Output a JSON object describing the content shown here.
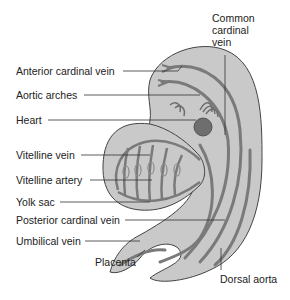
{
  "diagram": {
    "colors": {
      "body_fill": "#c9c9c9",
      "body_stroke": "#444444",
      "vessel": "#7a7a7a",
      "heart": "#6e6e6e",
      "leader_line": "#333333",
      "text": "#222222"
    },
    "labels": {
      "common_cardinal_vein": "Common\ncardinal\nvein",
      "common_cardinal_vein_l1": "Common",
      "common_cardinal_vein_l2": "cardinal",
      "common_cardinal_vein_l3": "vein",
      "anterior_cardinal_vein": "Anterior cardinal vein",
      "aortic_arches": "Aortic arches",
      "heart": "Heart",
      "vitelline_vein": "Vitelline vein",
      "vitelline_artery": "Vitelline artery",
      "yolk_sac": "Yolk sac",
      "posterior_cardinal_vein": "Posterior cardinal vein",
      "umbilical_vein": "Umbilical vein",
      "placenta": "Placenta",
      "dorsal_aorta": "Dorsal aorta"
    }
  }
}
